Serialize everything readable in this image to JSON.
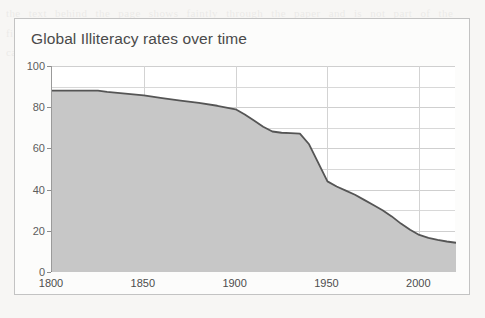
{
  "figure": {
    "title": "Global Illiteracy rates over time",
    "frame_border_color": "#c3c3c3",
    "background_color": "#fcfcfb"
  },
  "page": {
    "bleed_text": "the text behind the page shows faintly through the paper and is not part of the figure itself it repeats across the sheet in long justified lines of body copy that cannot be read at this size"
  },
  "chart_data": {
    "type": "area",
    "title": "Global Illiteracy rates over time",
    "xlabel": "",
    "ylabel": "",
    "xlim": [
      1800,
      2020
    ],
    "ylim": [
      0,
      100
    ],
    "grid": true,
    "legend": null,
    "x_ticks": [
      1800,
      1850,
      1900,
      1950,
      2000
    ],
    "x_tick_labels": [
      "1800",
      "1850",
      "1900",
      "1950",
      "2000"
    ],
    "y_ticks": [
      0,
      20,
      40,
      60,
      80,
      100
    ],
    "y_tick_labels": [
      "0",
      "20",
      "40",
      "60",
      "80",
      "100"
    ],
    "y_minor_ticks": [
      10,
      30,
      50,
      70,
      90
    ],
    "line_color": "#555555",
    "fill_color": "#c7c7c7",
    "series": [
      {
        "name": "Global illiteracy rate (%)",
        "x": [
          1800,
          1810,
          1820,
          1825,
          1830,
          1840,
          1850,
          1860,
          1870,
          1880,
          1890,
          1900,
          1905,
          1910,
          1915,
          1920,
          1925,
          1930,
          1935,
          1940,
          1945,
          1950,
          1955,
          1960,
          1965,
          1970,
          1975,
          1980,
          1985,
          1990,
          1995,
          2000,
          2005,
          2010,
          2015,
          2020
        ],
        "values": [
          88,
          88,
          88,
          88,
          87.4,
          86.6,
          85.7,
          84.4,
          83.2,
          82.1,
          80.7,
          79,
          76.5,
          73.5,
          70.5,
          68.2,
          67.6,
          67.4,
          67.2,
          62,
          53,
          44,
          41.5,
          39.5,
          37.5,
          35,
          32.5,
          30,
          27,
          23.5,
          20.5,
          18,
          16.6,
          15.6,
          14.8,
          14.2
        ]
      }
    ]
  }
}
